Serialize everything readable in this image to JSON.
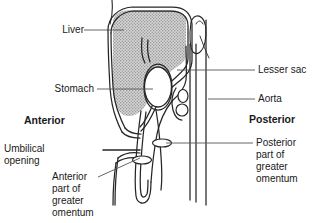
{
  "figure": {
    "colors": {
      "ink": "#1a1a1a",
      "stroke": "#262626",
      "liver_fill": "#cfcfcf",
      "background": "#ffffff",
      "leader": "#555555"
    }
  },
  "labels": {
    "liver": "Liver",
    "stomach": "Stomach",
    "anterior": "Anterior",
    "posterior": "Posterior",
    "umbilical_opening_line1": "Umbilical",
    "umbilical_opening_line2": "opening",
    "anterior_omentum_line1": "Anterior",
    "anterior_omentum_line2": "part of",
    "anterior_omentum_line3": "greater",
    "anterior_omentum_line4": "omentum",
    "lesser_sac": "Lesser sac",
    "aorta": "Aorta",
    "posterior_omentum_line1": "Posterior",
    "posterior_omentum_line2": "part of",
    "posterior_omentum_line3": "greater",
    "posterior_omentum_line4": "omentum"
  }
}
